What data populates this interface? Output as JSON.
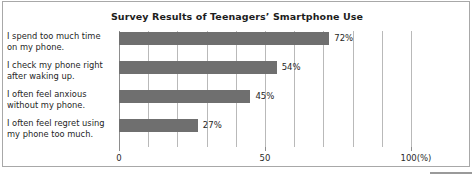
{
  "chart_data": {
    "type": "bar",
    "orientation": "horizontal",
    "title": "Survey Results of Teenagers’ Smartphone Use",
    "categories": [
      "I spend too much time on my phone.",
      "I check my phone right after waking up.",
      "I often feel anxious without my phone.",
      "I often feel regret using my phone too much."
    ],
    "category_lines": [
      [
        "I spend too much time",
        "on my phone."
      ],
      [
        "I check my phone right",
        "after waking up."
      ],
      [
        "I often feel anxious",
        "without my phone."
      ],
      [
        "I often feel regret using",
        "my phone too much."
      ]
    ],
    "values": [
      72,
      54,
      45,
      27
    ],
    "value_labels": [
      "72%",
      "54%",
      "45%",
      "27%"
    ],
    "xlabel": "",
    "ylabel": "",
    "xlim": [
      0,
      100
    ],
    "xticks": [
      0,
      50,
      100
    ],
    "xtick_labels": [
      "0",
      "50",
      "100(%)"
    ],
    "gridlines": [
      0,
      10,
      20,
      30,
      40,
      50,
      60,
      70,
      80,
      90,
      100
    ],
    "grid": true,
    "legend": false,
    "unit": "%",
    "bar_color": "#6f6f6f",
    "grid_color": "#b9b9b9",
    "axis_color": "#8d8d8d",
    "text_color": "#1f1f1f",
    "background": "#ffffff"
  }
}
